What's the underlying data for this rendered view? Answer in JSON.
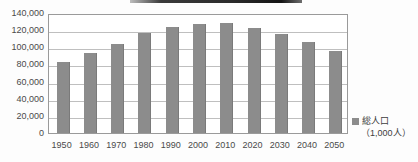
{
  "chart_data": {
    "type": "bar",
    "title": "",
    "xlabel": "",
    "ylabel": "",
    "categories": [
      "1950",
      "1960",
      "1970",
      "1980",
      "1990",
      "2000",
      "2010",
      "2020",
      "2030",
      "2040",
      "2050"
    ],
    "values": [
      83200,
      93400,
      103700,
      117100,
      123600,
      126900,
      128000,
      122700,
      115200,
      105700,
      95200
    ],
    "series": [
      {
        "name": "総人口",
        "values": [
          83200,
          93400,
          103700,
          117100,
          123600,
          126900,
          128000,
          122700,
          115200,
          105700,
          95200
        ]
      }
    ],
    "ylim": [
      0,
      140000
    ],
    "ytick_step": 20000,
    "ytick_labels": [
      "140,000",
      "120,000",
      "100,000",
      "80,000",
      "60,000",
      "40,000",
      "20,000",
      "0"
    ],
    "ytick_values": [
      140000,
      120000,
      100000,
      80000,
      60000,
      40000,
      20000,
      0
    ],
    "grid": true,
    "legend_position": "right",
    "bar_color": "#8c8c8c",
    "gridline_color": "#bfbfbf",
    "axis_color": "#9a9a9a"
  },
  "legend": {
    "label": "総人口",
    "unit": "（1,000人）",
    "swatch_color": "#8c8c8c"
  }
}
